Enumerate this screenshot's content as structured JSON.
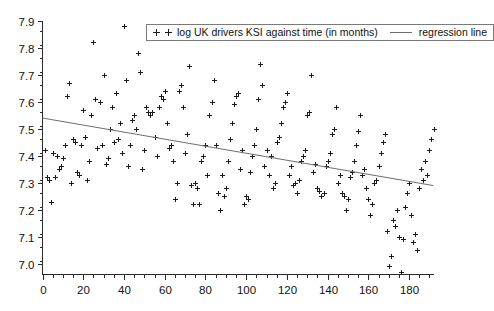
{
  "chart_data": {
    "type": "scatter",
    "title": "",
    "xlabel": "",
    "ylabel": "",
    "xlim": [
      0,
      192
    ],
    "ylim": [
      6.96,
      7.9
    ],
    "grid": false,
    "legend_position": "top-center",
    "x_ticks": [
      0,
      20,
      40,
      60,
      80,
      100,
      120,
      140,
      160,
      180
    ],
    "x_tick_labels": [
      "0",
      "20",
      "40",
      "60",
      "80",
      "100",
      "120",
      "140",
      "160",
      "180"
    ],
    "x_minor_step": 5,
    "y_ticks": [
      7.0,
      7.1,
      7.2,
      7.3,
      7.4,
      7.5,
      7.6,
      7.7,
      7.8,
      7.9
    ],
    "y_tick_labels": [
      "7.0",
      "7.1",
      "7.2",
      "7.3",
      "7.4",
      "7.5",
      "7.6",
      "7.7",
      "7.8",
      "7.9"
    ],
    "y_minor_step": 0.05,
    "series": [
      {
        "name": "log UK drivers KSI against time (in months)",
        "type": "scatter",
        "marker": "plus",
        "color": "#1c1c1c",
        "points": [
          [
            1,
            7.42
          ],
          [
            2,
            7.32
          ],
          [
            3,
            7.31
          ],
          [
            4,
            7.23
          ],
          [
            5,
            7.41
          ],
          [
            6,
            7.32
          ],
          [
            7,
            7.4
          ],
          [
            8,
            7.35
          ],
          [
            9,
            7.36
          ],
          [
            10,
            7.39
          ],
          [
            11,
            7.44
          ],
          [
            12,
            7.62
          ],
          [
            13,
            7.67
          ],
          [
            14,
            7.3
          ],
          [
            15,
            7.46
          ],
          [
            16,
            7.45
          ],
          [
            17,
            7.34
          ],
          [
            18,
            7.33
          ],
          [
            19,
            7.44
          ],
          [
            20,
            7.57
          ],
          [
            21,
            7.47
          ],
          [
            22,
            7.31
          ],
          [
            23,
            7.38
          ],
          [
            24,
            7.55
          ],
          [
            25,
            7.82
          ],
          [
            26,
            7.61
          ],
          [
            27,
            7.43
          ],
          [
            28,
            7.6
          ],
          [
            29,
            7.44
          ],
          [
            30,
            7.7
          ],
          [
            31,
            7.37
          ],
          [
            32,
            7.39
          ],
          [
            33,
            7.5
          ],
          [
            34,
            7.58
          ],
          [
            35,
            7.45
          ],
          [
            36,
            7.63
          ],
          [
            37,
            7.46
          ],
          [
            38,
            7.52
          ],
          [
            39,
            7.41
          ],
          [
            40,
            7.88
          ],
          [
            41,
            7.68
          ],
          [
            42,
            7.36
          ],
          [
            43,
            7.44
          ],
          [
            44,
            7.53
          ],
          [
            45,
            7.55
          ],
          [
            46,
            7.5
          ],
          [
            47,
            7.78
          ],
          [
            48,
            7.71
          ],
          [
            49,
            7.35
          ],
          [
            50,
            7.42
          ],
          [
            51,
            7.58
          ],
          [
            52,
            7.56
          ],
          [
            53,
            7.55
          ],
          [
            54,
            7.56
          ],
          [
            55,
            7.47
          ],
          [
            56,
            7.4
          ],
          [
            57,
            7.58
          ],
          [
            58,
            7.62
          ],
          [
            59,
            7.61
          ],
          [
            60,
            7.64
          ],
          [
            61,
            7.52
          ],
          [
            62,
            7.43
          ],
          [
            63,
            7.44
          ],
          [
            64,
            7.38
          ],
          [
            65,
            7.24
          ],
          [
            66,
            7.3
          ],
          [
            67,
            7.64
          ],
          [
            68,
            7.66
          ],
          [
            69,
            7.58
          ],
          [
            70,
            7.41
          ],
          [
            71,
            7.48
          ],
          [
            72,
            7.73
          ],
          [
            73,
            7.29
          ],
          [
            74,
            7.22
          ],
          [
            75,
            7.3
          ],
          [
            76,
            7.28
          ],
          [
            77,
            7.22
          ],
          [
            78,
            7.38
          ],
          [
            79,
            7.4
          ],
          [
            80,
            7.44
          ],
          [
            81,
            7.33
          ],
          [
            82,
            7.55
          ],
          [
            83,
            7.6
          ],
          [
            84,
            7.68
          ],
          [
            85,
            7.44
          ],
          [
            86,
            7.26
          ],
          [
            87,
            7.2
          ],
          [
            88,
            7.33
          ],
          [
            89,
            7.25
          ],
          [
            90,
            7.28
          ],
          [
            91,
            7.38
          ],
          [
            92,
            7.46
          ],
          [
            93,
            7.52
          ],
          [
            94,
            7.59
          ],
          [
            95,
            7.62
          ],
          [
            96,
            7.63
          ],
          [
            97,
            7.35
          ],
          [
            98,
            7.42
          ],
          [
            99,
            7.22
          ],
          [
            100,
            7.25
          ],
          [
            101,
            7.24
          ],
          [
            102,
            7.34
          ],
          [
            103,
            7.4
          ],
          [
            104,
            7.44
          ],
          [
            105,
            7.5
          ],
          [
            106,
            7.61
          ],
          [
            107,
            7.74
          ],
          [
            108,
            7.66
          ],
          [
            109,
            7.36
          ],
          [
            110,
            7.42
          ],
          [
            111,
            7.33
          ],
          [
            112,
            7.4
          ],
          [
            113,
            7.28
          ],
          [
            114,
            7.3
          ],
          [
            115,
            7.45
          ],
          [
            116,
            7.47
          ],
          [
            117,
            7.52
          ],
          [
            118,
            7.58
          ],
          [
            119,
            7.6
          ],
          [
            120,
            7.63
          ],
          [
            121,
            7.33
          ],
          [
            122,
            7.36
          ],
          [
            123,
            7.29
          ],
          [
            124,
            7.3
          ],
          [
            125,
            7.26
          ],
          [
            126,
            7.31
          ],
          [
            127,
            7.38
          ],
          [
            128,
            7.4
          ],
          [
            129,
            7.42
          ],
          [
            130,
            7.55
          ],
          [
            131,
            7.56
          ],
          [
            132,
            7.7
          ],
          [
            133,
            7.34
          ],
          [
            134,
            7.37
          ],
          [
            135,
            7.28
          ],
          [
            136,
            7.27
          ],
          [
            137,
            7.25
          ],
          [
            138,
            7.26
          ],
          [
            139,
            7.36
          ],
          [
            140,
            7.38
          ],
          [
            141,
            7.41
          ],
          [
            142,
            7.48
          ],
          [
            143,
            7.5
          ],
          [
            144,
            7.58
          ],
          [
            145,
            7.3
          ],
          [
            146,
            7.33
          ],
          [
            147,
            7.26
          ],
          [
            148,
            7.25
          ],
          [
            149,
            7.2
          ],
          [
            150,
            7.24
          ],
          [
            151,
            7.32
          ],
          [
            152,
            7.34
          ],
          [
            153,
            7.38
          ],
          [
            154,
            7.44
          ],
          [
            155,
            7.49
          ],
          [
            156,
            7.55
          ],
          [
            157,
            7.33
          ],
          [
            158,
            7.35
          ],
          [
            159,
            7.28
          ],
          [
            160,
            7.24
          ],
          [
            161,
            7.18
          ],
          [
            162,
            7.22
          ],
          [
            163,
            7.3
          ],
          [
            164,
            7.31
          ],
          [
            165,
            7.36
          ],
          [
            166,
            7.41
          ],
          [
            167,
            7.45
          ],
          [
            168,
            7.48
          ],
          [
            169,
            7.12
          ],
          [
            170,
            6.99
          ],
          [
            171,
            7.03
          ],
          [
            172,
            7.16
          ],
          [
            173,
            7.14
          ],
          [
            174,
            7.2
          ],
          [
            175,
            7.1
          ],
          [
            176,
            6.97
          ],
          [
            177,
            7.09
          ],
          [
            178,
            7.21
          ],
          [
            179,
            7.26
          ],
          [
            180,
            7.3
          ],
          [
            181,
            7.18
          ],
          [
            182,
            7.08
          ],
          [
            183,
            7.11
          ],
          [
            184,
            7.05
          ],
          [
            185,
            7.28
          ],
          [
            186,
            7.35
          ],
          [
            187,
            7.31
          ],
          [
            188,
            7.38
          ],
          [
            189,
            7.33
          ],
          [
            190,
            7.42
          ],
          [
            191,
            7.46
          ],
          [
            192,
            7.5
          ]
        ]
      },
      {
        "name": "regression line",
        "type": "line",
        "color": "#6e6e6e",
        "endpoints": [
          [
            0,
            7.539
          ],
          [
            192,
            7.289
          ]
        ]
      }
    ]
  },
  "legend": {
    "marker_glyph": "+",
    "scatter_label": "log UK drivers KSI against time (in months)",
    "line_label": "regression line"
  }
}
